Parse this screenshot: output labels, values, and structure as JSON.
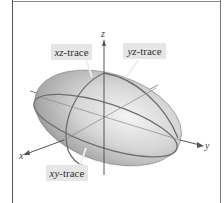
{
  "figure": {
    "type": "ellipsoid-traces",
    "axes": {
      "x": "x",
      "y": "y",
      "z": "z"
    },
    "labels": [
      {
        "id": "xz",
        "var": "xz",
        "suffix": "-trace"
      },
      {
        "id": "yz",
        "var": "yz",
        "suffix": "-trace"
      },
      {
        "id": "xy",
        "var": "xy",
        "suffix": "-trace"
      }
    ],
    "colors": {
      "surface": "#c8c8c8",
      "trace": "#6e6e6e",
      "axis": "#555555",
      "label_bg": "#e6e6e6"
    }
  }
}
